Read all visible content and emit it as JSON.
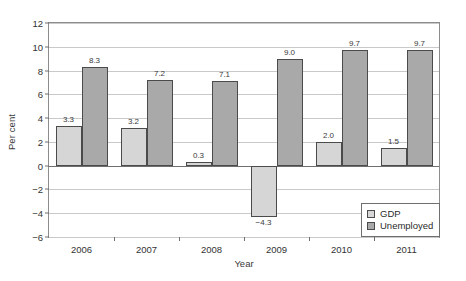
{
  "chart_data": {
    "type": "bar",
    "title": "",
    "xlabel": "Year",
    "ylabel": "Per cent",
    "categories": [
      "2006",
      "2007",
      "2008",
      "2009",
      "2010",
      "2011"
    ],
    "series": [
      {
        "name": "GDP",
        "color": "#d6d6d6",
        "values": [
          3.3,
          3.2,
          0.3,
          -4.3,
          2.0,
          1.5
        ]
      },
      {
        "name": "Unemployed",
        "color": "#a9a9a9",
        "values": [
          8.3,
          7.2,
          7.1,
          9.0,
          9.7,
          9.7
        ]
      }
    ],
    "data_labels": {
      "GDP": [
        "3.3",
        "3.2",
        "0.3",
        "-4.3",
        "2.0",
        "1.5"
      ],
      "Unemployed": [
        "8.3",
        "7.2",
        "7.1",
        "9.0",
        "9.7",
        "9.7"
      ]
    },
    "ylim": [
      -6,
      12
    ],
    "yticks": [
      12,
      10,
      8,
      6,
      4,
      2,
      0,
      -2,
      -4,
      -6
    ],
    "ytick_labels": [
      "12",
      "10",
      "8",
      "6",
      "4",
      "2",
      "0",
      "-2",
      "-4",
      "-6"
    ],
    "grid": true,
    "legend_position": "bottom-right",
    "legend_entries": [
      "GDP",
      "Unemployed"
    ]
  },
  "axes": {
    "y_title": "Per cent",
    "x_title": "Year"
  },
  "legend": {
    "items": [
      {
        "label": "GDP"
      },
      {
        "label": "Unemployed"
      }
    ]
  }
}
